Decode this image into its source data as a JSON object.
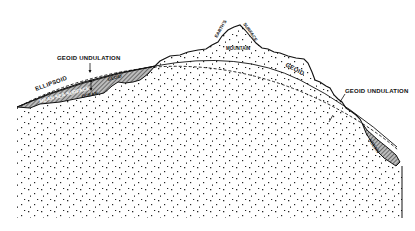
{
  "diagram": {
    "labels": {
      "geoid_undulation_left": "GEOID UNDULATION",
      "geoid_undulation_right": "GEOID UNDULATION",
      "ellipsoid": "ELLIPSOID",
      "mean_sea_surface": "MEAN SEA SURFACE",
      "geoid_ocean": "GEOID",
      "ocean_left": "OCEAN",
      "ocean_right": "OCEAN",
      "earths": "EARTH'S",
      "surface": "SURFACE",
      "mountain": "MOUNTAIN",
      "geoid_land": "GEOID"
    },
    "colors": {
      "ink": "#111111",
      "background": "#ffffff",
      "ocean_fill": "#9a9a9a"
    }
  }
}
